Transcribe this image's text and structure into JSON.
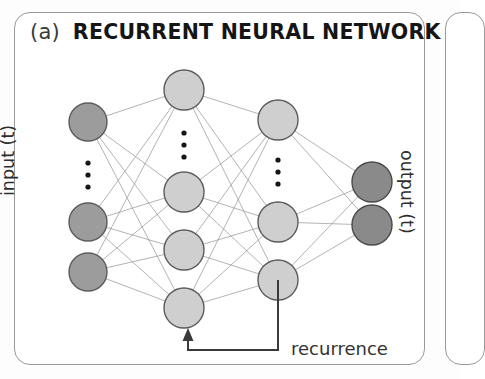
{
  "figure": {
    "panel_letter": "(a)",
    "title": "RECURRENT NEURAL NETWORK",
    "input_label": "input (t)",
    "output_label": "output (t)",
    "recurrence_label": "recurrence"
  },
  "colors": {
    "input_node": "#9c9c9c",
    "hidden_node": "#cfcfcf",
    "output_node": "#8a8a8a",
    "edge": "#999999",
    "frame": "#9a9a9a",
    "recurrence": "#3a3a3a",
    "title_text": "#151515"
  },
  "chart_data": {
    "type": "diagram",
    "title": "RECURRENT NEURAL NETWORK",
    "subtitle": "(a)",
    "layers": [
      {
        "name": "input",
        "label": "input (t)",
        "x": 88,
        "radius": 19,
        "node_y": [
          122,
          222,
          272
        ],
        "ellipsis_y": [
          163,
          175,
          187
        ],
        "truncated": true,
        "fill": "#9c9c9c"
      },
      {
        "name": "hidden-1",
        "label": "hidden layer 1",
        "x": 184,
        "radius": 20,
        "node_y": [
          90,
          192,
          250,
          308
        ],
        "ellipsis_y": [
          133,
          145,
          157
        ],
        "truncated": true,
        "fill": "#cfcfcf"
      },
      {
        "name": "hidden-2",
        "label": "hidden layer 2",
        "x": 278,
        "radius": 20,
        "node_y": [
          120,
          222,
          280
        ],
        "ellipsis_y": [
          160,
          172,
          184
        ],
        "truncated": true,
        "fill": "#cfcfcf"
      },
      {
        "name": "output",
        "label": "output (t)",
        "x": 372,
        "radius": 20,
        "node_y": [
          182,
          225
        ],
        "ellipsis_y": [],
        "truncated": false,
        "fill": "#8a8a8a"
      }
    ],
    "connections": "fully-connected between adjacent layers",
    "recurrence": {
      "label": "recurrence",
      "from_layer": "hidden-2",
      "from_node_y": 280,
      "to_layer": "hidden-1",
      "to_node_y": 308,
      "path_x_start": 278,
      "path_y_bottom": 350,
      "path_x_end": 188,
      "arrow_tip_y": 328
    }
  }
}
